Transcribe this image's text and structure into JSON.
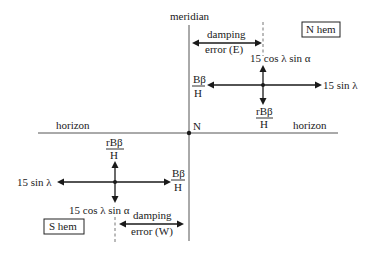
{
  "diagram": {
    "axes": {
      "meridian_label": "meridian",
      "horizon_left_label": "horizon",
      "horizon_right_label": "horizon",
      "origin_label": "N"
    },
    "north": {
      "box_label": "N hem",
      "damping_line1": "damping",
      "damping_line2": "error (E)",
      "up_label": "15 cos λ sin α",
      "left_num": "Bβ",
      "left_den": "H",
      "right_label": "15 sin λ",
      "down_num": "rBβ",
      "down_den": "H"
    },
    "south": {
      "box_label": "S hem",
      "damping_line1": "damping",
      "damping_line2": "error (W)",
      "down_label": "15 cos λ sin α",
      "right_num": "Bβ",
      "right_den": "H",
      "left_label": "15 sin λ",
      "up_num": "rBβ",
      "up_den": "H"
    }
  }
}
